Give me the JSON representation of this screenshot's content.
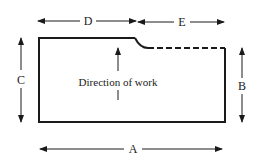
{
  "diagram": {
    "labels": {
      "A": "A",
      "B": "B",
      "C": "C",
      "D": "D",
      "E": "E"
    },
    "center_text": "Direction of work",
    "colors": {
      "stroke": "#1a1a1a",
      "background": "#ffffff"
    }
  }
}
